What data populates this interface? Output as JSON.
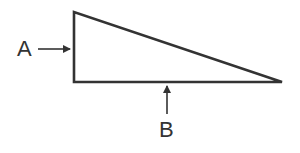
{
  "diagram": {
    "type": "right-triangle",
    "stroke_color": "#333333",
    "labels": {
      "a": "A",
      "b": "B"
    },
    "vertices": {
      "top_left": [
        74,
        12
      ],
      "bottom_left": [
        74,
        82
      ],
      "right": [
        282,
        82
      ]
    }
  }
}
